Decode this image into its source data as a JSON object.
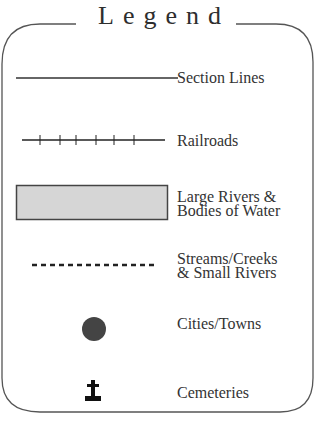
{
  "legend": {
    "title": "Legend",
    "items": [
      {
        "symbol": "solid-line",
        "label": "Section Lines"
      },
      {
        "symbol": "railroad-line",
        "label": "Railroads"
      },
      {
        "symbol": "shaded-rectangle",
        "label_line1": "Large Rivers &",
        "label_line2": "Bodies of Water"
      },
      {
        "symbol": "dashed-line",
        "label_line1": "Streams/Creeks",
        "label_line2": "& Small Rivers"
      },
      {
        "symbol": "filled-circle",
        "label": "Cities/Towns"
      },
      {
        "symbol": "cemetery-cross",
        "label": "Cemeteries"
      }
    ],
    "colors": {
      "border": "#555555",
      "text": "#333333",
      "water_fill": "#d6d6d6",
      "city_fill": "#444444",
      "symbol": "#222222"
    }
  }
}
